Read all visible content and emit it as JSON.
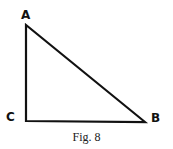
{
  "figure": {
    "caption": "Fig. 8",
    "shape": "right-triangle",
    "stroke_color": "#111111",
    "vertices": [
      {
        "label": "A",
        "x": 26,
        "y": 25,
        "label_x": 21,
        "label_y": 9
      },
      {
        "label": "C",
        "x": 26,
        "y": 121,
        "label_x": 6,
        "label_y": 111
      },
      {
        "label": "B",
        "x": 145,
        "y": 122,
        "label_x": 151,
        "label_y": 112
      }
    ],
    "right_angle_at": "C"
  }
}
